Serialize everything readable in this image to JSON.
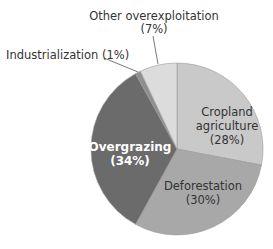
{
  "chart_data": {
    "type": "pie",
    "title": "",
    "start_angle_deg": 0,
    "direction": "clockwise",
    "categories": [
      "Cropland agriculture",
      "Deforestation",
      "Overgrazing",
      "Industrialization",
      "Other overexploitation"
    ],
    "values": [
      28,
      30,
      34,
      1,
      7
    ],
    "units": "%",
    "colors": [
      "#c9c9c9",
      "#a8a8a8",
      "#6b6b6b",
      "#8f8f8f",
      "#dcdcdc"
    ],
    "slice_stroke": "#9a9a9a",
    "legend": "none (direct labels)"
  },
  "labels": {
    "cropland": {
      "line1": "Cropland",
      "line2": "agriculture",
      "line3": "(28%)"
    },
    "deforestation": {
      "line1": "Deforestation",
      "line2": "(30%)"
    },
    "overgrazing": {
      "line1": "Overgrazing",
      "line2": "(34%)"
    },
    "industrialization": {
      "line1": "Industrialization (1%)"
    },
    "other": {
      "line1": "Other overexploitation",
      "line2": "(7%)"
    }
  }
}
